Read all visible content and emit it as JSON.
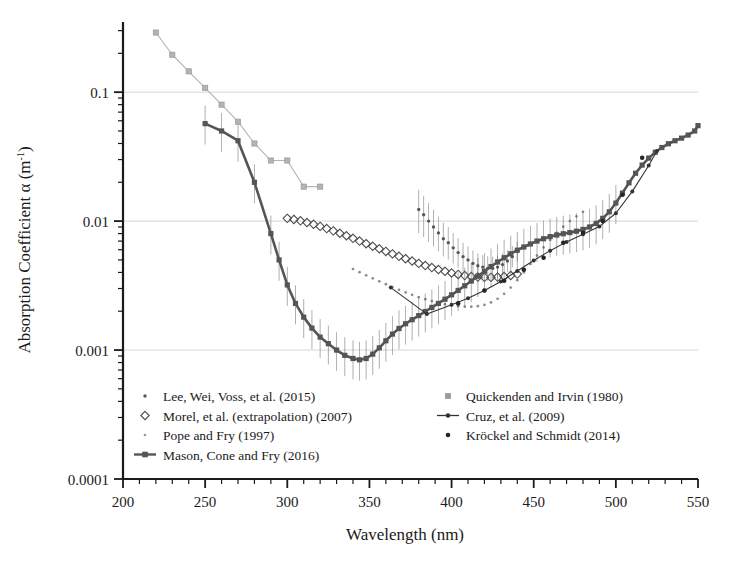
{
  "figure": {
    "title": "",
    "background": "#ffffff"
  },
  "chart_data": {
    "type": "line",
    "title": "",
    "xlabel": "Wavelength (nm)",
    "ylabel": "Absorption Coefficient α (m⁻¹)",
    "ylabel_parts": {
      "prefix": "Absorption Coefficient α (m",
      "sup": "-1",
      "suffix": ")"
    },
    "xscale": "linear",
    "yscale": "log",
    "xlim": [
      200,
      550
    ],
    "ylim": [
      0.0001,
      0.35
    ],
    "grid": "horizontal-major",
    "grid_color": "#cccccc",
    "xticks_major": [
      200,
      250,
      300,
      350,
      400,
      450,
      500,
      550
    ],
    "xtick_labels": [
      "200",
      "250",
      "300",
      "350",
      "400",
      "450",
      "500",
      "550"
    ],
    "xtick_minor_step": 10,
    "yticks_major": [
      0.0001,
      0.001,
      0.01,
      0.1
    ],
    "ytick_labels": [
      "0.0001",
      "0.001",
      "0.01",
      "0.1"
    ],
    "legend_position": "lower-center-inside",
    "series": [
      {
        "name": "Lee, Wei, Voss, et al. (2015)",
        "marker": "small-dot",
        "color": "#595959",
        "line": false,
        "errorbars": true,
        "x": [
          380,
          383,
          386,
          389,
          392,
          395,
          398,
          401,
          404,
          407,
          410,
          413,
          416,
          419,
          422,
          425,
          428,
          431,
          434,
          437,
          440
        ],
        "y": [
          0.0123,
          0.0112,
          0.01,
          0.009,
          0.0081,
          0.0073,
          0.0068,
          0.0062,
          0.0057,
          0.0053,
          0.005,
          0.0047,
          0.0045,
          0.0044,
          0.0043,
          0.0043,
          0.0044,
          0.0046,
          0.0049,
          0.0053,
          0.0058
        ],
        "yerr_frac": [
          0.42,
          0.4,
          0.38,
          0.36,
          0.34,
          0.33,
          0.32,
          0.3,
          0.29,
          0.28,
          0.27,
          0.26,
          0.25,
          0.24,
          0.24,
          0.23,
          0.23,
          0.22,
          0.22,
          0.21,
          0.2
        ]
      },
      {
        "name": "Morel, et al. (extrapolation) (2007)",
        "marker": "open-diamond",
        "color": "#4d4d4d",
        "line": false,
        "errorbars": false,
        "x": [
          300,
          304,
          308,
          312,
          316,
          320,
          324,
          328,
          332,
          336,
          340,
          344,
          348,
          352,
          356,
          360,
          364,
          368,
          372,
          376,
          380,
          384,
          388,
          392,
          396,
          400,
          404,
          408,
          412,
          416,
          420,
          424,
          428,
          432,
          436,
          440
        ],
        "y": [
          0.0105,
          0.0103,
          0.01005,
          0.00975,
          0.00945,
          0.0091,
          0.00875,
          0.0084,
          0.00805,
          0.0077,
          0.00735,
          0.007,
          0.00668,
          0.00638,
          0.0061,
          0.00582,
          0.00557,
          0.00533,
          0.00511,
          0.0049,
          0.0047,
          0.00452,
          0.00436,
          0.00421,
          0.00408,
          0.00396,
          0.00386,
          0.00378,
          0.00372,
          0.00368,
          0.00366,
          0.00366,
          0.00368,
          0.00372,
          0.00379,
          0.00388
        ]
      },
      {
        "name": "Pope and Fry (1997)",
        "marker": "tiny-dot",
        "color": "#8c8c8c",
        "line": false,
        "errorbars": false,
        "x": [
          340,
          344,
          348,
          352,
          356,
          360,
          364,
          368,
          372,
          376,
          380,
          384,
          388,
          392,
          396,
          400,
          404,
          408,
          412,
          416,
          420,
          424,
          428,
          432,
          436,
          440,
          444,
          448,
          452,
          456,
          460,
          464,
          468,
          472,
          476,
          480
        ],
        "y": [
          0.00425,
          0.00402,
          0.0038,
          0.0036,
          0.00341,
          0.00324,
          0.00308,
          0.00293,
          0.0028,
          0.00268,
          0.00257,
          0.00248,
          0.0024,
          0.00233,
          0.00227,
          0.00222,
          0.00219,
          0.00217,
          0.00217,
          0.00219,
          0.00224,
          0.00234,
          0.0025,
          0.00273,
          0.00305,
          0.00348,
          0.004,
          0.00465,
          0.0054,
          0.00625,
          0.00715,
          0.0081,
          0.00905,
          0.01,
          0.0109,
          0.0118
        ]
      },
      {
        "name": "Mason, Cone and Fry (2016)",
        "marker": "filled-square",
        "color": "#555555",
        "line": true,
        "errorbars": true,
        "x": [
          250,
          260,
          270,
          280,
          290,
          295,
          300,
          305,
          310,
          315,
          320,
          325,
          330,
          335,
          340,
          344,
          348,
          352,
          356,
          360,
          364,
          368,
          372,
          376,
          380,
          384,
          388,
          392,
          396,
          400,
          404,
          408,
          412,
          416,
          420,
          424,
          428,
          432,
          436,
          440,
          444,
          448,
          452,
          456,
          460,
          464,
          468,
          472,
          476,
          480,
          484,
          488,
          492,
          496,
          500,
          504,
          508,
          512,
          516,
          520,
          524,
          528,
          532,
          536,
          540,
          544,
          548,
          550
        ],
        "y": [
          0.057,
          0.05,
          0.042,
          0.02,
          0.008,
          0.005,
          0.0032,
          0.0023,
          0.0018,
          0.00148,
          0.00126,
          0.00112,
          0.001,
          0.00091,
          0.00086,
          0.00084,
          0.00086,
          0.00093,
          0.00104,
          0.00118,
          0.00133,
          0.00147,
          0.0016,
          0.00172,
          0.00185,
          0.00199,
          0.00214,
          0.0023,
          0.00248,
          0.00268,
          0.0029,
          0.00315,
          0.00343,
          0.00374,
          0.00408,
          0.00444,
          0.00482,
          0.0052,
          0.00558,
          0.00595,
          0.0063,
          0.00665,
          0.007,
          0.0073,
          0.00758,
          0.0078,
          0.00798,
          0.00815,
          0.00835,
          0.00862,
          0.009,
          0.0096,
          0.0105,
          0.0118,
          0.0138,
          0.0165,
          0.0198,
          0.0235,
          0.0272,
          0.0308,
          0.0342,
          0.0372,
          0.0398,
          0.042,
          0.044,
          0.0465,
          0.05,
          0.055
        ],
        "errorbar_x_start": 250,
        "errorbar_x_end": 500,
        "yerr_frac_default": 0.38
      },
      {
        "name": "Quickenden and Irvin (1980)",
        "marker": "small-square-light",
        "color": "#b3b3b3",
        "line": true,
        "errorbars": false,
        "x": [
          220,
          230,
          240,
          250,
          260,
          270,
          280,
          290,
          300,
          310,
          320
        ],
        "y": [
          0.29,
          0.195,
          0.145,
          0.108,
          0.08,
          0.059,
          0.04,
          0.0295,
          0.0295,
          0.0185,
          0.0185
        ]
      },
      {
        "name": "Cruz, et al. (2009)",
        "marker": "small-dot-dark",
        "color": "#333333",
        "line": true,
        "errorbars": false,
        "x": [
          363,
          385,
          400,
          410,
          420,
          430,
          440,
          450,
          460,
          470,
          480,
          490,
          500,
          510,
          520,
          525
        ],
        "y": [
          0.00305,
          0.0019,
          0.00225,
          0.00252,
          0.0029,
          0.0034,
          0.0041,
          0.00495,
          0.0059,
          0.0069,
          0.0079,
          0.0091,
          0.0115,
          0.017,
          0.027,
          0.035
        ]
      },
      {
        "name": "Kröckel and Schmidt (2014)",
        "marker": "dot-dark",
        "color": "#262626",
        "line": false,
        "errorbars": false,
        "x": [
          404,
          420,
          432,
          444,
          456,
          468,
          480,
          492,
          504,
          516
        ],
        "y": [
          0.0023,
          0.0029,
          0.00345,
          0.0042,
          0.0052,
          0.0068,
          0.0081,
          0.01,
          0.016,
          0.031
        ]
      }
    ]
  },
  "legend": {
    "entries": [
      {
        "label": "Lee, Wei, Voss, et al. (2015)",
        "marker": "small-dot",
        "column": 0
      },
      {
        "label": "Morel, et al. (extrapolation) (2007)",
        "marker": "open-diamond",
        "column": 0
      },
      {
        "label": "Pope and Fry (1997)",
        "marker": "tiny-dot",
        "column": 0
      },
      {
        "label": "Mason, Cone and Fry (2016)",
        "marker": "line-square",
        "column": 0
      },
      {
        "label": "Quickenden and Irvin (1980)",
        "marker": "small-square-light",
        "column": 1
      },
      {
        "label": "Cruz, et al. (2009)",
        "marker": "line-dot",
        "column": 1
      },
      {
        "label": "Kröckel and Schmidt (2014)",
        "marker": "dot-dark",
        "column": 1
      }
    ]
  }
}
